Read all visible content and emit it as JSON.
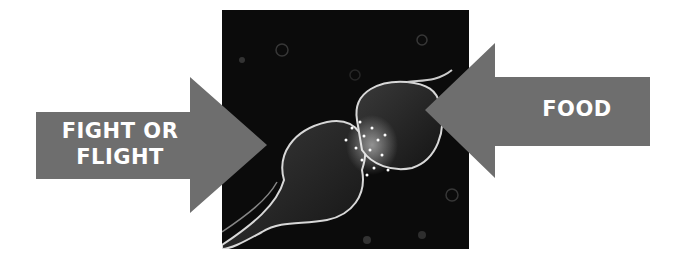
{
  "diagram": {
    "left_arrow": {
      "label_line1": "FIGHT OR",
      "label_line2": "FLIGHT",
      "color": "#6e6e6e"
    },
    "right_arrow": {
      "label": "FOOD",
      "color": "#6e6e6e"
    },
    "center_image": {
      "subject": "synapse-illustration",
      "background": "#0b0b0b"
    }
  }
}
